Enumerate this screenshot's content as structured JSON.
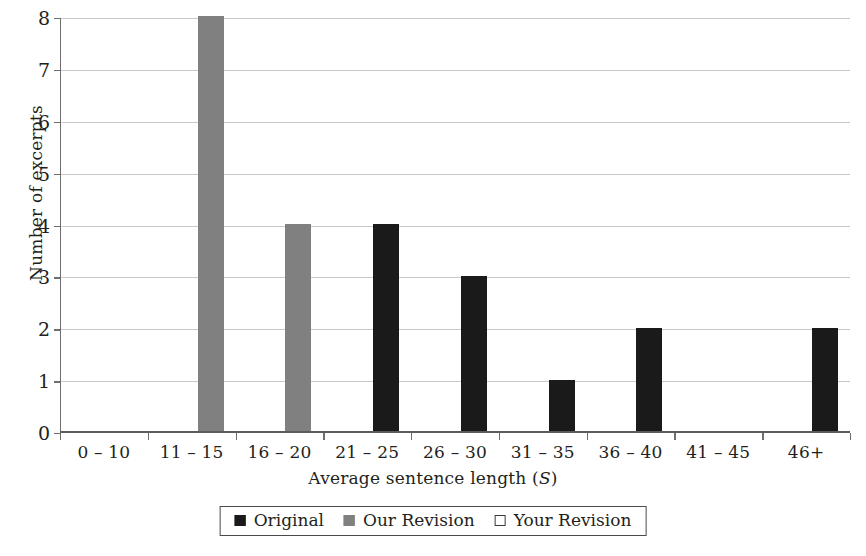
{
  "chart_data": {
    "type": "bar",
    "title": "",
    "subtitle": "",
    "xlabel": "Average sentence length (S)",
    "xlabel_text": "Average sentence length (",
    "xlabel_var": "S",
    "xlabel_tail": ")",
    "ylabel": "Number of excerpts",
    "categories": [
      "0 – 10",
      "11 – 15",
      "16 – 20",
      "21 – 25",
      "26 – 30",
      "31 – 35",
      "36 – 40",
      "41 – 45",
      "46+"
    ],
    "series": [
      {
        "name": "Original",
        "color": "#1a1a1a",
        "values": [
          0,
          0,
          0,
          4,
          3,
          1,
          2,
          0,
          2
        ]
      },
      {
        "name": "Our Revision",
        "color": "#808080",
        "values": [
          0,
          8,
          4,
          0,
          0,
          0,
          0,
          0,
          0
        ]
      },
      {
        "name": "Your Revision",
        "color": "#ffffff",
        "values": [
          0,
          0,
          0,
          0,
          0,
          0,
          0,
          0,
          0
        ]
      }
    ],
    "ylim": [
      0,
      8
    ],
    "ytick_labels": [
      "0",
      "1",
      "2",
      "3",
      "4",
      "5",
      "6",
      "7",
      "8"
    ],
    "ytick_values": [
      0,
      1,
      2,
      3,
      4,
      5,
      6,
      7,
      8
    ],
    "grid": true,
    "grid_axis": "y",
    "grid_color": "#c9c9c9",
    "legend_position": "bottom",
    "legend_border_color": "#4a4a4a",
    "axis_color": "#6e6e6e",
    "background": "#ffffff"
  }
}
